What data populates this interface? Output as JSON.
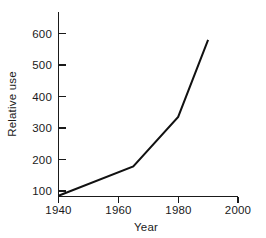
{
  "chart_data": {
    "type": "line",
    "title": "",
    "xlabel": "Year",
    "ylabel": "Relative use",
    "xlim": [
      1940,
      2000
    ],
    "ylim": [
      60,
      640
    ],
    "xticks": [
      1940,
      1960,
      1980,
      2000
    ],
    "xtick_labels": [
      "1940",
      "1960",
      "1980",
      "2000"
    ],
    "yticks": [
      100,
      200,
      300,
      400,
      500,
      600
    ],
    "ytick_labels": [
      "100",
      "200",
      "300",
      "400",
      "500",
      "600"
    ],
    "grid": false,
    "legend": false,
    "series": [
      {
        "name": "Relative use",
        "x": [
          1940,
          1965,
          1980,
          1990
        ],
        "values": [
          85,
          178,
          335,
          580
        ]
      }
    ],
    "line_color": "#111111",
    "axis_color": "#1a1a1a",
    "background_color": "#ffffff"
  },
  "axes": {
    "x_tick_0": "1940",
    "x_tick_1": "1960",
    "x_tick_2": "1980",
    "x_tick_3": "2000",
    "y_tick_0": "100",
    "y_tick_1": "200",
    "y_tick_2": "300",
    "y_tick_3": "400",
    "y_tick_4": "500",
    "y_tick_5": "600",
    "x_title": "Year",
    "y_title": "Relative use"
  }
}
